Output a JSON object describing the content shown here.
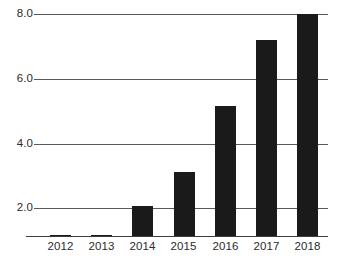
{
  "chart_data": {
    "type": "bar",
    "title": "",
    "subtitle": "",
    "xlabel": "",
    "ylabel": "",
    "categories": [
      "2012",
      "2013",
      "2014",
      "2015",
      "2016",
      "2017",
      "2018"
    ],
    "values": [
      0.15,
      0.4,
      2.05,
      3.1,
      5.15,
      7.2,
      8.0
    ],
    "series": [
      {
        "name": "",
        "values": [
          0.15,
          0.4,
          2.05,
          3.1,
          5.15,
          7.2,
          8.0
        ]
      }
    ],
    "ylim": [
      0,
      8.6
    ],
    "xlim": [
      0,
      7
    ],
    "ytick_labels": [
      "8.0",
      "6.0",
      "4.0",
      "2.0"
    ],
    "ytick_values": [
      8.0,
      6.0,
      4.0,
      2.0
    ],
    "xtick_labels": [
      "2012",
      "2013",
      "2014",
      "2015",
      "2016",
      "2017",
      "2018"
    ],
    "grid": true,
    "grid_axis": "y",
    "legend": false,
    "legend_position": "none",
    "bar_color": "#1a1a1a",
    "grid_color": "#5a5a5a",
    "axis_color": "#3d3d3d",
    "text_color": "#2b2b2b",
    "background": "#ffffff",
    "annotations": []
  },
  "axis": {
    "y_labels": [
      {
        "text": "8.0",
        "value": 8.0
      },
      {
        "text": "6.0",
        "value": 6.0
      },
      {
        "text": "4.0",
        "value": 4.0
      },
      {
        "text": "2.0",
        "value": 2.0
      }
    ],
    "x_labels": [
      {
        "text": "2012"
      },
      {
        "text": "2013"
      },
      {
        "text": "2014"
      },
      {
        "text": "2015"
      },
      {
        "text": "2016"
      },
      {
        "text": "2017"
      },
      {
        "text": "2018"
      }
    ]
  }
}
